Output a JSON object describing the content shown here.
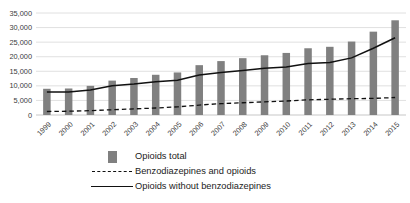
{
  "chart_data": {
    "type": "bar",
    "title": "",
    "subtitle": "",
    "xlabel": "",
    "ylabel": "",
    "ylim": [
      0,
      35000
    ],
    "ytick_values": [
      0,
      5000,
      10000,
      15000,
      20000,
      25000,
      30000,
      35000
    ],
    "ytick_labels": [
      "0",
      "5,000",
      "10,000",
      "15,000",
      "20,000",
      "25,000",
      "30,000",
      "35,000"
    ],
    "grid": true,
    "legend_position": "bottom",
    "categories": [
      "1999",
      "2000",
      "2001",
      "2002",
      "2003",
      "2004",
      "2005",
      "2006",
      "2007",
      "2008",
      "2009",
      "2010",
      "2011",
      "2012",
      "2013",
      "2014",
      "2015"
    ],
    "series": [
      {
        "name": "Opioids total",
        "type": "bar",
        "color": "#808080",
        "values": [
          9000,
          9100,
          10000,
          11800,
          12700,
          13800,
          14600,
          17100,
          18500,
          19500,
          20500,
          21300,
          22900,
          23400,
          25200,
          28600,
          32500
        ]
      },
      {
        "name": "Benzodiazepines and opioids",
        "type": "line",
        "style": "dashed",
        "color": "#111111",
        "values": [
          1200,
          1300,
          1500,
          1800,
          2100,
          2400,
          2800,
          3400,
          3900,
          4200,
          4500,
          4800,
          5200,
          5400,
          5600,
          5700,
          6000
        ]
      },
      {
        "name": "Opioids without benzodiazepines",
        "type": "line",
        "style": "solid",
        "color": "#111111",
        "values": [
          7900,
          7900,
          8600,
          10000,
          10600,
          11400,
          11900,
          13700,
          14600,
          15300,
          16000,
          16500,
          17700,
          18000,
          19600,
          22900,
          26500
        ]
      }
    ]
  },
  "legend": {
    "items": [
      {
        "label": "Opioids total",
        "marker": "bar-swatch-icon"
      },
      {
        "label": "Benzodiazepines and opioids",
        "marker": "dashed-line-icon"
      },
      {
        "label": "Opioids without benzodiazepines",
        "marker": "solid-line-icon"
      }
    ]
  }
}
